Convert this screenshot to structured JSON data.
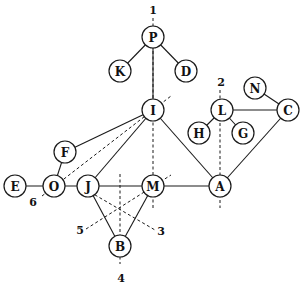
{
  "diagram": {
    "type": "graph",
    "node_radius": 11,
    "nodes": [
      {
        "id": "P",
        "label": "P",
        "x": 153,
        "y": 37
      },
      {
        "id": "K",
        "label": "K",
        "x": 120,
        "y": 71
      },
      {
        "id": "D",
        "label": "D",
        "x": 186,
        "y": 71
      },
      {
        "id": "I",
        "label": "I",
        "x": 153,
        "y": 110
      },
      {
        "id": "L",
        "label": "L",
        "x": 222,
        "y": 110
      },
      {
        "id": "N",
        "label": "N",
        "x": 255,
        "y": 88
      },
      {
        "id": "C",
        "label": "C",
        "x": 288,
        "y": 110
      },
      {
        "id": "H",
        "label": "H",
        "x": 199,
        "y": 133
      },
      {
        "id": "G",
        "label": "G",
        "x": 243,
        "y": 133
      },
      {
        "id": "F",
        "label": "F",
        "x": 65,
        "y": 152
      },
      {
        "id": "E",
        "label": "E",
        "x": 15,
        "y": 186
      },
      {
        "id": "O",
        "label": "O",
        "x": 54,
        "y": 186
      },
      {
        "id": "J",
        "label": "J",
        "x": 88,
        "y": 186
      },
      {
        "id": "M",
        "label": "M",
        "x": 153,
        "y": 186
      },
      {
        "id": "A",
        "label": "A",
        "x": 220,
        "y": 186
      },
      {
        "id": "B",
        "label": "B",
        "x": 120,
        "y": 246
      }
    ],
    "edges": [
      [
        "P",
        "K"
      ],
      [
        "P",
        "D"
      ],
      [
        "P",
        "I"
      ],
      [
        "I",
        "F"
      ],
      [
        "I",
        "J"
      ],
      [
        "I",
        "A"
      ],
      [
        "L",
        "H"
      ],
      [
        "L",
        "G"
      ],
      [
        "L",
        "C"
      ],
      [
        "N",
        "C"
      ],
      [
        "C",
        "A"
      ],
      [
        "F",
        "O"
      ],
      [
        "E",
        "O"
      ],
      [
        "O",
        "J"
      ],
      [
        "J",
        "M"
      ],
      [
        "M",
        "A"
      ],
      [
        "J",
        "B"
      ],
      [
        "M",
        "B"
      ]
    ],
    "cuts": [
      {
        "id": "1",
        "label": "1",
        "x1": 153,
        "y1": 18,
        "x2": 153,
        "y2": 210,
        "lx": 153,
        "ly": 10
      },
      {
        "id": "2",
        "label": "2",
        "x1": 220,
        "y1": 90,
        "x2": 220,
        "y2": 208,
        "lx": 221,
        "ly": 82
      },
      {
        "id": "3",
        "label": "3",
        "x1": 90,
        "y1": 192,
        "x2": 155,
        "y2": 230,
        "lx": 161,
        "ly": 231
      },
      {
        "id": "4",
        "label": "4",
        "x1": 120,
        "y1": 174,
        "x2": 120,
        "y2": 264,
        "lx": 121,
        "ly": 278
      },
      {
        "id": "5",
        "label": "5",
        "x1": 86,
        "y1": 229,
        "x2": 171,
        "y2": 175,
        "lx": 80,
        "ly": 230
      },
      {
        "id": "6",
        "label": "6",
        "x1": 42,
        "y1": 196,
        "x2": 171,
        "y2": 96,
        "lx": 33,
        "ly": 202
      }
    ]
  }
}
